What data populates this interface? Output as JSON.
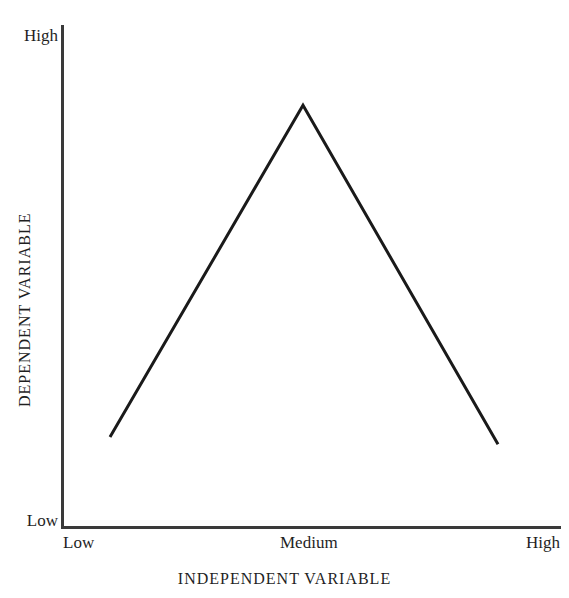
{
  "chart_data": {
    "type": "line",
    "title": "",
    "subtitle": "",
    "xlabel": "INDEPENDENT VARIABLE",
    "ylabel": "DEPENDENT VARIABLE",
    "x_tick_labels": [
      "Low",
      "Medium",
      "High"
    ],
    "y_tick_labels": [
      "Low",
      "High"
    ],
    "xlim": [
      0,
      100
    ],
    "ylim": [
      0,
      100
    ],
    "grid": false,
    "legend": "none",
    "annotations": [],
    "series": [
      {
        "name": "inverted-u-relationship",
        "x": [
          9.8,
          48.4,
          87.4
        ],
        "y": [
          17.9,
          84.0,
          16.5
        ],
        "points": [
          {
            "x_label": "Low",
            "y_value": 17.9
          },
          {
            "x_label": "Medium",
            "y_value": 84.0
          },
          {
            "x_label": "High",
            "y_value": 16.5
          }
        ],
        "color": "#1a1a1a",
        "line_width": 3,
        "markers": false
      }
    ]
  },
  "axes": {
    "y_axis": {
      "top_label": "High",
      "bottom_label": "Low",
      "title": "DEPENDENT VARIABLE",
      "color": "#3a3a3a"
    },
    "x_axis": {
      "left_label": "Low",
      "center_label": "Medium",
      "right_label": "High",
      "title": "INDEPENDENT VARIABLE",
      "color": "#3a3a3a"
    }
  },
  "figure": {
    "background": "#ffffff",
    "ink": "#1a1a1a"
  }
}
